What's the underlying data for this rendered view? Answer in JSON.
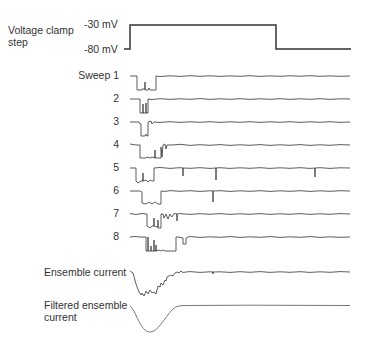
{
  "voltage": {
    "label_line1": "Voltage clamp",
    "label_line2": "step",
    "high_label": "-30 mV",
    "low_label": "-80 mV"
  },
  "sweeps": [
    {
      "label": "Sweep 1"
    },
    {
      "label": "2"
    },
    {
      "label": "3"
    },
    {
      "label": "4"
    },
    {
      "label": "5"
    },
    {
      "label": "6"
    },
    {
      "label": "7"
    },
    {
      "label": "8"
    }
  ],
  "ensemble": {
    "label": "Ensemble current"
  },
  "filtered": {
    "label_line1": "Filtered ensemble",
    "label_line2": "current"
  },
  "colors": {
    "trace": "#333333",
    "filtered_trace": "#777777",
    "text": "#333333"
  }
}
